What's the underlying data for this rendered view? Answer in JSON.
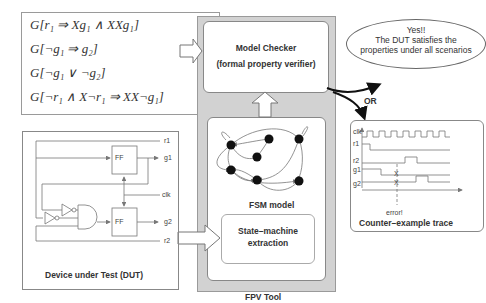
{
  "properties": {
    "lines": [
      "G[r₁ ⇒ Xg₁ ∧ XXg₁]",
      "G[¬g₁ ⇒ g₂]",
      "G[¬g₁ ∨ ¬g₂]",
      "G[¬r₁ ∧ X¬r₁ ⇒ XX¬g₁]"
    ]
  },
  "fpv_tool": {
    "label": "FPV Tool",
    "model_checker": {
      "title": "Model Checker",
      "subtitle": "(formal property verifier)"
    },
    "fsm_model": {
      "label": "FSM model"
    },
    "state_machine_extraction": {
      "line1": "State–machine",
      "line2": "extraction"
    }
  },
  "dut": {
    "caption": "Device under Test (DUT)",
    "flipflops": [
      "FF",
      "FF"
    ],
    "signals": [
      "r1",
      "g1",
      "clk",
      "g2",
      "r2"
    ]
  },
  "result_yes": {
    "line1": "Yes!!",
    "line2": "The DUT satisfies the",
    "line3": "properties under all scenarios"
  },
  "or_label": "OR",
  "counter_example": {
    "caption": "Counter–example trace",
    "signals": [
      "clk",
      "r1",
      "r2",
      "g1",
      "g2"
    ],
    "error_label": "error!"
  },
  "colors": {
    "fpv_bg": "#d2d2d2",
    "border": "#888888",
    "state": "#111111"
  }
}
